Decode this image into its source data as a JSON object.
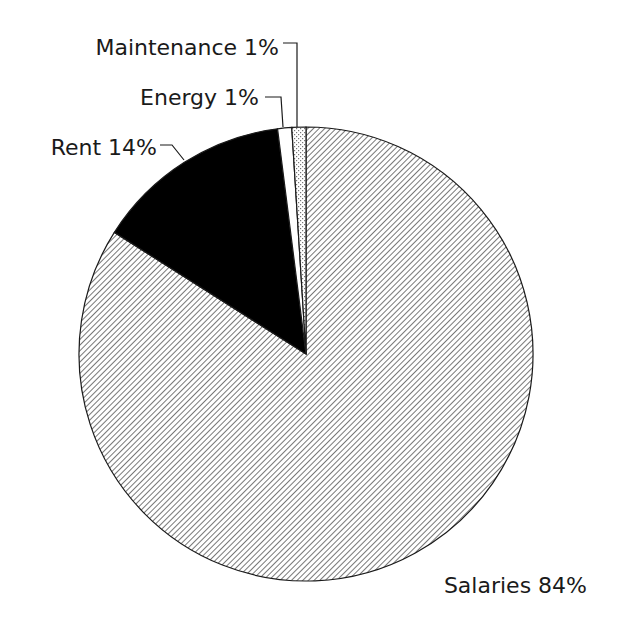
{
  "chart_data": {
    "type": "pie",
    "title": "",
    "start_angle_deg": 0,
    "direction": "clockwise",
    "slices": [
      {
        "label": "Salaries",
        "value": 84,
        "display": "Salaries 84%",
        "pattern": "hatch"
      },
      {
        "label": "Rent",
        "value": 14,
        "display": "Rent 14%",
        "pattern": "solid-black"
      },
      {
        "label": "Energy",
        "value": 1,
        "display": "Energy 1%",
        "pattern": "white"
      },
      {
        "label": "Maintenance",
        "value": 1,
        "display": "Maintenance 1%",
        "pattern": "dots"
      }
    ],
    "categories": [
      "Salaries",
      "Rent",
      "Energy",
      "Maintenance"
    ],
    "values": [
      84,
      14,
      1,
      1
    ],
    "unit": "%",
    "legend": "none (inline labels with leader lines)"
  },
  "labels": {
    "salaries": "Salaries 84%",
    "rent": "Rent 14%",
    "energy": "Energy 1%",
    "maintenance": "Maintenance 1%"
  },
  "colors": {
    "outline": "#1a1a1a",
    "rent_fill": "#000000",
    "energy_fill": "#ffffff",
    "background": "#ffffff"
  }
}
